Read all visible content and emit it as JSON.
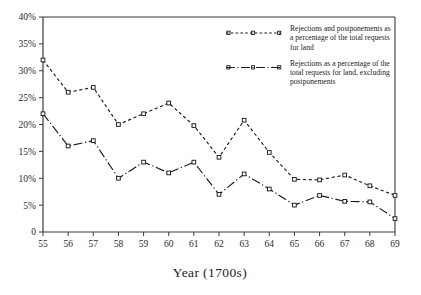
{
  "chart_data": {
    "type": "line",
    "title": "",
    "xlabel": "Year (1700s)",
    "ylabel": "",
    "x": [
      "55",
      "56",
      "57",
      "58",
      "59",
      "60",
      "61",
      "62",
      "63",
      "64",
      "65",
      "66",
      "67",
      "68",
      "69"
    ],
    "categories": [
      "55",
      "56",
      "57",
      "58",
      "59",
      "60",
      "61",
      "62",
      "63",
      "64",
      "65",
      "66",
      "67",
      "68",
      "69"
    ],
    "xlim": [
      55,
      69
    ],
    "ylim": [
      0,
      40
    ],
    "yticks": [
      0,
      5,
      10,
      15,
      20,
      25,
      30,
      35,
      40
    ],
    "ytick_labels": [
      "0",
      "5%",
      "10%",
      "15%",
      "20%",
      "25%",
      "30%",
      "35%",
      "40%"
    ],
    "xtick_labels": [
      "55",
      "56",
      "57",
      "58",
      "59",
      "60",
      "61",
      "62",
      "63",
      "64",
      "65",
      "66",
      "67",
      "68",
      "69"
    ],
    "grid": false,
    "legend_position": "top-right inside plot",
    "series": [
      {
        "name": "Rejections and postponements as a percentage of the total requests for land",
        "style": "dashed",
        "marker": "square",
        "color": "#1c1c1c",
        "values": [
          32,
          26,
          26.9,
          20,
          22,
          24,
          19.8,
          13.9,
          20.8,
          14.8,
          9.8,
          9.7,
          10.6,
          8.6,
          6.8
        ]
      },
      {
        "name": "Rejections as a percentage of the total requests for land, excluding postponements",
        "style": "dash-dot",
        "marker": "square",
        "color": "#1c1c1c",
        "values": [
          22,
          16,
          17,
          10,
          13,
          11,
          13,
          7,
          10.8,
          8,
          5,
          6.8,
          5.7,
          5.6,
          2.5
        ]
      }
    ]
  },
  "legend": {
    "entries": [
      {
        "label": "Rejections and postponements as a percentage of the total requests for land"
      },
      {
        "label": "Rejections as a percentage of the total requests for land, excluding postponements"
      }
    ]
  },
  "axis": {
    "x_title": "Year (1700s)"
  },
  "colors": {
    "ink": "#1c1c1c",
    "axis": "#3a3a3a",
    "background": "#ffffff"
  }
}
